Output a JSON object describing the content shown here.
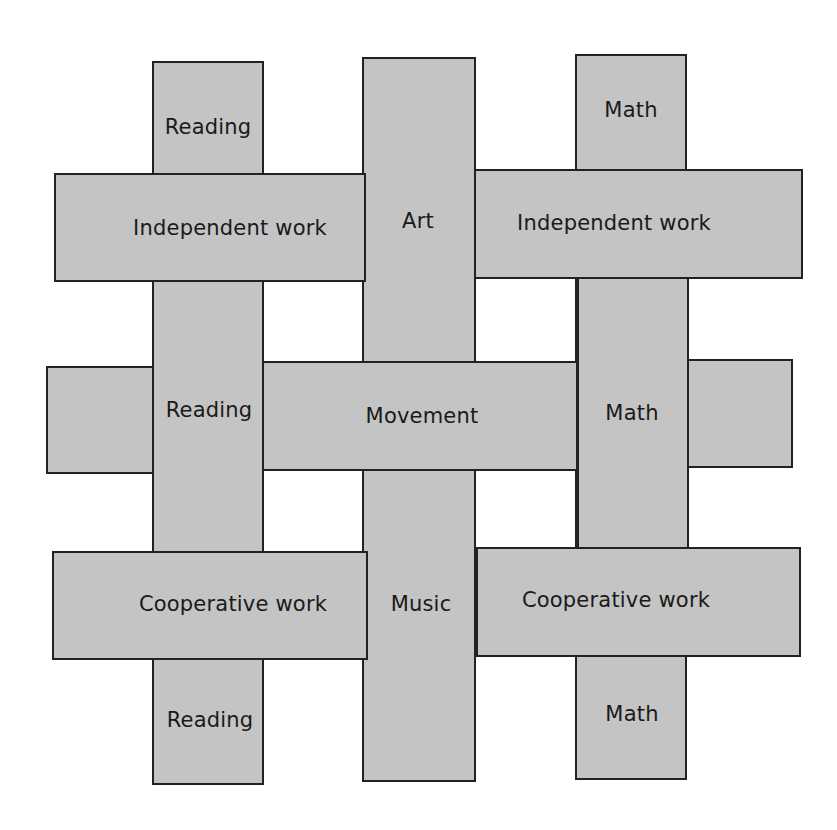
{
  "diagram": {
    "title": "",
    "colors": {
      "strip_fill": "#c4c4c4",
      "strip_border": "#222222",
      "background": "#ffffff"
    },
    "columns": [
      {
        "id": "reading",
        "labels": [
          "Reading",
          "Reading",
          "Reading"
        ]
      },
      {
        "id": "center",
        "labels": [
          "Art",
          "Music"
        ]
      },
      {
        "id": "math",
        "labels": [
          "Math",
          "Math",
          "Math"
        ]
      }
    ],
    "rows": [
      {
        "id": "row-top",
        "labels": [
          "Independent work",
          "Independent work"
        ]
      },
      {
        "id": "row-middle",
        "labels": [
          "Movement"
        ]
      },
      {
        "id": "row-bottom",
        "labels": [
          "Cooperative work",
          "Cooperative work"
        ]
      }
    ]
  }
}
